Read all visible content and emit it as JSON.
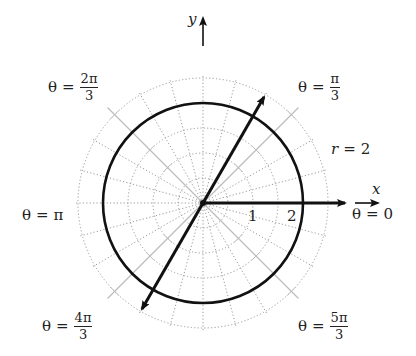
{
  "diagram": {
    "type": "polar-coordinate-plot",
    "axes": {
      "x_label": "x",
      "y_label": "y"
    },
    "circle": {
      "label": "r = 2",
      "r_var": "r",
      "r_value": "2"
    },
    "radial_ticks": [
      "1",
      "2"
    ],
    "rays": [
      {
        "name": "theta-0",
        "lhs": "θ",
        "eq": "=",
        "num": "0",
        "den": ""
      },
      {
        "name": "theta-pi-3",
        "lhs": "θ",
        "eq": "=",
        "num": "π",
        "den": "3"
      },
      {
        "name": "theta-2pi-3",
        "lhs": "θ",
        "eq": "=",
        "num": "2π",
        "den": "3"
      },
      {
        "name": "theta-pi",
        "lhs": "θ",
        "eq": "=",
        "num": "π",
        "den": ""
      },
      {
        "name": "theta-4pi-3",
        "lhs": "θ",
        "eq": "=",
        "num": "4π",
        "den": "3"
      },
      {
        "name": "theta-5pi-3",
        "lhs": "θ",
        "eq": "=",
        "num": "5π",
        "den": "3"
      }
    ],
    "colors": {
      "ink": "#111111",
      "grid_dotted": "#9a9a9a",
      "grid_solid": "#bdbdbd",
      "background": "#ffffff"
    }
  }
}
